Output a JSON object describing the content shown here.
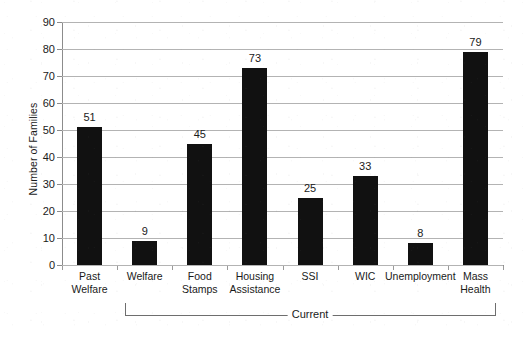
{
  "chart_data": {
    "type": "bar",
    "title": "",
    "xlabel": "",
    "ylabel": "Number of Families",
    "ylim": [
      0,
      90
    ],
    "ytick_step": 10,
    "yticks": [
      0,
      10,
      20,
      30,
      40,
      50,
      60,
      70,
      80,
      90
    ],
    "grid": true,
    "legend": "none",
    "bar_color": "#111111",
    "gridline_color": "#b3b3b3",
    "axis_color": "#8c8c8c",
    "categories": [
      "Past Welfare",
      "Welfare",
      "Food Stamps",
      "Housing Assistance",
      "SSI",
      "WIC",
      "Unemployment",
      "Mass Health"
    ],
    "category_lines": [
      [
        "Past",
        "Welfare"
      ],
      [
        "Welfare"
      ],
      [
        "Food",
        "Stamps"
      ],
      [
        "Housing",
        "Assistance"
      ],
      [
        "SSI"
      ],
      [
        "WIC"
      ],
      [
        "Unemployment"
      ],
      [
        "Mass",
        "Health"
      ]
    ],
    "values": [
      51,
      9,
      45,
      73,
      25,
      33,
      8,
      79
    ],
    "annotations": [
      {
        "label": "Current",
        "type": "bracket",
        "spans_categories": [
          "Welfare",
          "Mass Health"
        ]
      }
    ]
  }
}
